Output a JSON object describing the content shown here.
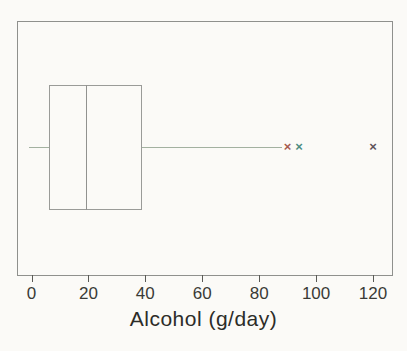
{
  "page": {
    "background": "#fbfaf7",
    "text_color": "#33332f"
  },
  "chart_data": {
    "type": "boxplot",
    "orientation": "horizontal",
    "title": "",
    "xlabel": "Alcohol (g/day)",
    "ylabel": "",
    "xlim": [
      -5,
      127
    ],
    "xticks": [
      0,
      20,
      40,
      60,
      80,
      100,
      120
    ],
    "grid": false,
    "legend": false,
    "box": {
      "whisker_low": 0,
      "q1": 6,
      "median": 19,
      "q3": 39,
      "whisker_high": 88
    },
    "outliers": [
      {
        "value": 90,
        "marker": "x",
        "color": "#a65a4e"
      },
      {
        "value": 94,
        "marker": "x",
        "color": "#4c8d82"
      },
      {
        "value": 120,
        "marker": "x",
        "color": "#5e535a"
      }
    ],
    "colors": {
      "frame": "#8f908d",
      "box_border": "#9a9b98",
      "median_line": "#91928f",
      "whisker": "#a3b1a0",
      "tick": "#5a5a56",
      "tick_label": "#3a3a36",
      "axis_title": "#2c2c28"
    }
  }
}
